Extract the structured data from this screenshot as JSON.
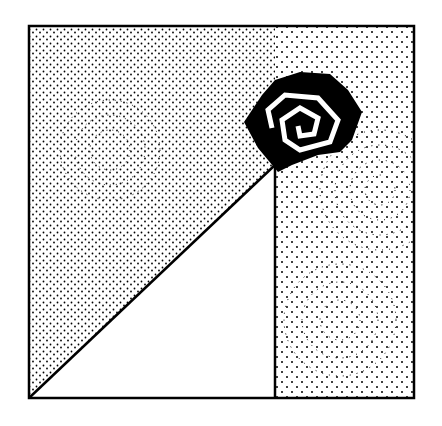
{
  "figure": {
    "colors": {
      "ink": "#000000",
      "paper": "#ffffff"
    },
    "frame": {
      "x": 29,
      "y": 26,
      "width": 385,
      "height": 372
    },
    "vertical_line_x": 275,
    "apex": {
      "x": 275,
      "y": 165
    },
    "rose_center": {
      "x": 300,
      "y": 120
    }
  }
}
